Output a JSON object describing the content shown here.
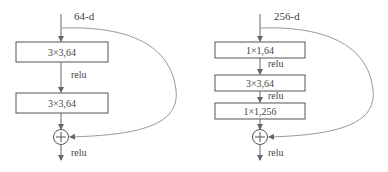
{
  "diagram": {
    "left_block": {
      "input_label": "64-d",
      "layers": [
        {
          "label": "3×3,64"
        },
        {
          "label": "3×3,64"
        }
      ],
      "activations": [
        "relu",
        "relu"
      ],
      "add_symbol": "+"
    },
    "right_block": {
      "input_label": "256-d",
      "layers": [
        {
          "label": "1×1,64"
        },
        {
          "label": "3×3,64"
        },
        {
          "label": "1×1,256"
        }
      ],
      "activations": [
        "relu",
        "relu",
        "relu"
      ],
      "add_symbol": "+"
    },
    "colors": {
      "box_stroke": "#555555",
      "line": "#666666",
      "skip_curve": "#999999",
      "text": "#444444"
    }
  }
}
